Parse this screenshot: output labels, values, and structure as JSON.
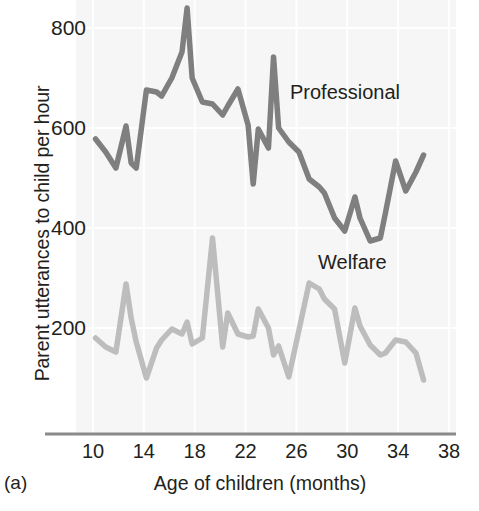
{
  "figure": {
    "panel_label": "(a)",
    "xlabel": "Age of children (months)",
    "ylabel": "Parent utterances to child per hour"
  },
  "colors": {
    "professional": "#7f7f7f",
    "welfare": "#bdbdbd",
    "axis": "#8a8a8a",
    "text": "#231f20",
    "plot_background": "#f7f7f7"
  },
  "chart_data": {
    "type": "line",
    "title": "",
    "subtitle": "",
    "xlabel": "Age of children (months)",
    "ylabel": "Parent utterances to child per hour",
    "xlim": [
      10,
      38
    ],
    "ylim": [
      0,
      860
    ],
    "xticks": [
      10,
      14,
      18,
      22,
      26,
      30,
      34,
      38
    ],
    "yticks": [
      200,
      400,
      600,
      800
    ],
    "xtick_labels": [
      "10",
      "14",
      "18",
      "22",
      "26",
      "30",
      "34",
      "38"
    ],
    "ytick_labels": [
      "200",
      "400",
      "600",
      "800"
    ],
    "grid": true,
    "legend_position": "inline-annotation",
    "annotations": [
      {
        "text": "Professional",
        "x": 24.5,
        "y": 690
      },
      {
        "text": "Welfare",
        "x": 26.8,
        "y": 345
      },
      {
        "text": "(a)",
        "x": null,
        "y": null
      }
    ],
    "x": [
      10.2,
      11.0,
      11.8,
      12.6,
      13.0,
      13.4,
      14.2,
      15.0,
      15.4,
      16.2,
      17.0,
      17.4,
      17.8,
      18.6,
      19.4,
      20.2,
      20.6,
      21.4,
      22.2,
      22.6,
      23.0,
      23.8,
      24.2,
      24.6,
      25.4,
      26.2,
      27.0,
      27.8,
      28.2,
      29.0,
      29.8,
      30.6,
      31.0,
      31.8,
      32.6,
      33.0,
      33.8,
      34.6,
      35.4,
      36.0
    ],
    "series": [
      {
        "name": "Professional",
        "color": "#7f7f7f",
        "values": [
          578,
          552,
          520,
          604,
          530,
          520,
          676,
          672,
          664,
          700,
          752,
          840,
          700,
          652,
          648,
          626,
          644,
          678,
          606,
          488,
          598,
          560,
          742,
          600,
          572,
          552,
          498,
          482,
          470,
          420,
          394,
          462,
          420,
          374,
          380,
          430,
          534,
          474,
          512,
          546
        ]
      },
      {
        "name": "Welfare",
        "color": "#bdbdbd",
        "values": [
          180,
          162,
          152,
          288,
          220,
          172,
          100,
          160,
          176,
          198,
          188,
          212,
          168,
          180,
          380,
          162,
          230,
          188,
          182,
          184,
          238,
          200,
          146,
          164,
          102,
          196,
          290,
          278,
          258,
          238,
          130,
          240,
          204,
          166,
          146,
          150,
          176,
          172,
          150,
          96
        ]
      }
    ]
  }
}
